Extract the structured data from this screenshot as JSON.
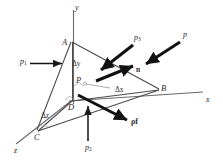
{
  "figure": {
    "type": "3d-vector-diagram",
    "stroke_color": "#3a3a3a",
    "arrow_color": "#111111",
    "background": "#ffffff"
  },
  "axes": [
    {
      "name": "y-axis",
      "label": "y",
      "x": 75,
      "y": 4
    },
    {
      "name": "x-axis",
      "label": "x",
      "x": 206,
      "y": 96
    },
    {
      "name": "z-axis",
      "label": "z",
      "x": 14,
      "y": 147
    }
  ],
  "vertices": [
    {
      "name": "vertex-a",
      "label": "A",
      "x": 62,
      "y": 38
    },
    {
      "name": "vertex-b",
      "label": "B",
      "x": 161,
      "y": 84
    },
    {
      "name": "vertex-c",
      "label": "C",
      "x": 34,
      "y": 133
    },
    {
      "name": "vertex-d",
      "label": "D",
      "x": 68,
      "y": 103
    },
    {
      "name": "point-p",
      "label": "P",
      "x": 76,
      "y": 83
    }
  ],
  "dimensions": [
    {
      "name": "delta-y",
      "label": "Δy",
      "x": 72,
      "y": 62
    },
    {
      "name": "delta-x",
      "label": "Δx",
      "x": 115,
      "y": 89
    },
    {
      "name": "delta-z",
      "label": "Δz",
      "x": 41,
      "y": 115
    }
  ],
  "vectors": [
    {
      "name": "pressure-p1",
      "label": "p",
      "sub": "1",
      "x": 20,
      "y": 60
    },
    {
      "name": "pressure-p2",
      "label": "p",
      "sub": "2",
      "x": 86,
      "y": 147
    },
    {
      "name": "pressure-p3",
      "label": "p",
      "sub": "3",
      "x": 134,
      "y": 38
    },
    {
      "name": "pressure-p",
      "label": "p",
      "sub": "",
      "x": 182,
      "y": 35
    },
    {
      "name": "normal-n",
      "label": "n",
      "x": 136,
      "y": 68
    },
    {
      "name": "body-force-rho-f",
      "label": "ρf",
      "x": 133,
      "y": 122
    }
  ]
}
